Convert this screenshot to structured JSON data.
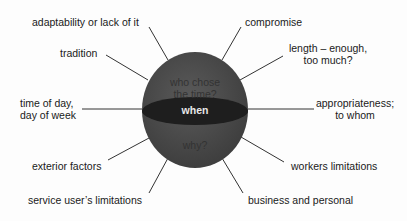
{
  "diagram": {
    "center_label": "when",
    "sphere_upper_text": [
      "who chose",
      "the time?"
    ],
    "sphere_lower_text": "why?",
    "colors": {
      "sphere": "#4a4a4a",
      "band": "#1e1e1e",
      "line": "#333333",
      "center_text": "#e8e8e8"
    },
    "spokes": [
      {
        "label": "adaptability or lack of it"
      },
      {
        "label": "tradition"
      },
      {
        "label": "time of day,",
        "label2": "day of week"
      },
      {
        "label": "exterior factors"
      },
      {
        "label": "service user’s limitations"
      },
      {
        "label": "compromise"
      },
      {
        "label": "length – enough,",
        "label2": "too much?"
      },
      {
        "label": "appropriateness;",
        "label2": "to whom"
      },
      {
        "label": "workers limitations"
      },
      {
        "label": "business and personal"
      }
    ]
  }
}
